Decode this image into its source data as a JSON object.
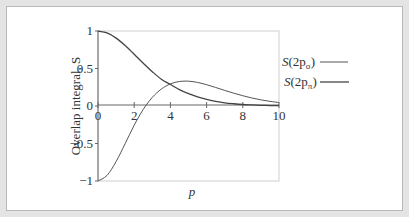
{
  "chart_data": {
    "type": "line",
    "title": "",
    "xlabel": "p",
    "ylabel": "Overlap integral, S",
    "xlim": [
      0,
      10
    ],
    "ylim": [
      -1,
      1
    ],
    "xticks": [
      "0",
      "2",
      "4",
      "6",
      "8",
      "10"
    ],
    "yticks": [
      "1",
      "0.5",
      "0",
      "−0.5",
      "−1"
    ],
    "grid": false,
    "legend_position": "right",
    "x": [
      0,
      0.5,
      1,
      1.5,
      2,
      2.5,
      3,
      3.5,
      4,
      4.5,
      5,
      5.5,
      6,
      6.5,
      7,
      7.5,
      8,
      8.5,
      9,
      9.5,
      10
    ],
    "series": [
      {
        "name": "S(2pσ)",
        "values": [
          -1.0,
          -0.925,
          -0.741,
          -0.502,
          -0.256,
          -0.045,
          0.115,
          0.226,
          0.295,
          0.327,
          0.331,
          0.314,
          0.284,
          0.247,
          0.208,
          0.171,
          0.137,
          0.107,
          0.082,
          0.062,
          0.046
        ]
      },
      {
        "name": "S(2pπ)",
        "values": [
          1.0,
          0.974,
          0.905,
          0.806,
          0.69,
          0.571,
          0.458,
          0.357,
          0.287,
          0.219,
          0.164,
          0.121,
          0.087,
          0.062,
          0.043,
          0.03,
          0.02,
          0.014,
          0.009,
          0.006,
          0.004
        ]
      }
    ]
  },
  "legend": [
    {
      "prefix": "S(2p",
      "sub": "σ",
      "suffix": ")"
    },
    {
      "prefix": "S(2p",
      "sub": "π",
      "suffix": ")"
    }
  ],
  "colors": {
    "line": "#444444",
    "axis": "#666666",
    "frame_outer": "#e4e4e4",
    "frame_border": "#b8b8b8",
    "plot_border": "#cccccc"
  }
}
